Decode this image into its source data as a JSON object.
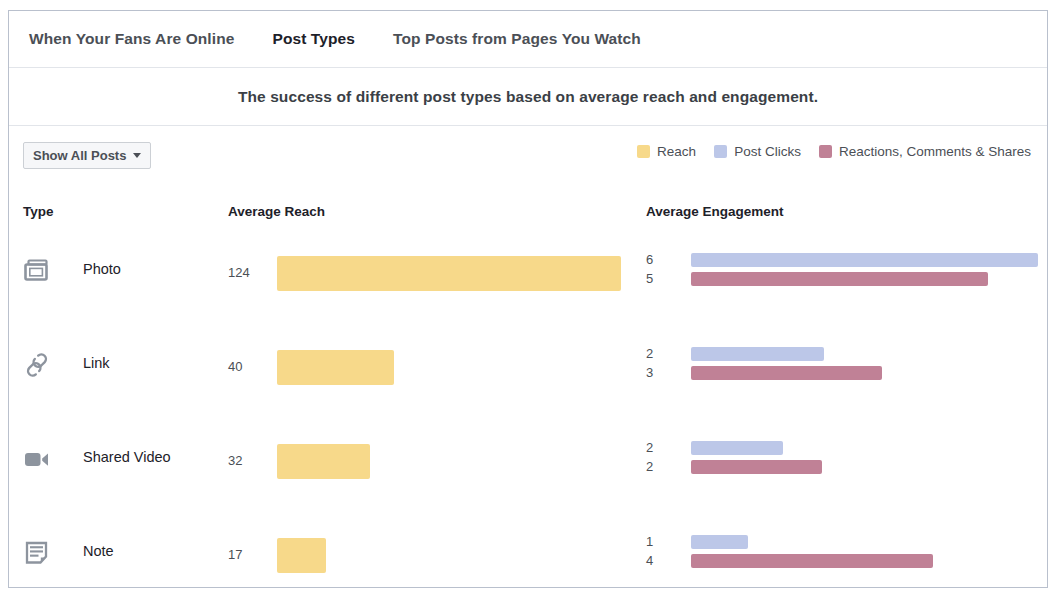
{
  "tabs": [
    {
      "label": "When Your Fans Are Online",
      "active": false
    },
    {
      "label": "Post Types",
      "active": true
    },
    {
      "label": "Top Posts from Pages You Watch",
      "active": false
    }
  ],
  "subtitle": "The success of different post types based on average reach and engagement.",
  "filter": {
    "label": "Show All Posts"
  },
  "legend": [
    {
      "label": "Reach",
      "color": "#f7d98a"
    },
    {
      "label": "Post Clicks",
      "color": "#bcc7e8"
    },
    {
      "label": "Reactions, Comments & Shares",
      "color": "#c08196"
    }
  ],
  "columns": {
    "type": "Type",
    "average_reach": "Average Reach",
    "average_engagement": "Average Engagement"
  },
  "chart_data": {
    "type": "bar",
    "title": "The success of different post types based on average reach and engagement.",
    "orientation": "horizontal",
    "categories": [
      "Photo",
      "Link",
      "Shared Video",
      "Note"
    ],
    "series": [
      {
        "name": "Reach",
        "color": "#f7d98a",
        "values": [
          124,
          40,
          32,
          17
        ]
      },
      {
        "name": "Post Clicks",
        "color": "#bcc7e8",
        "values": [
          6,
          2,
          2,
          1
        ]
      },
      {
        "name": "Reactions, Comments & Shares",
        "color": "#c08196",
        "values": [
          5,
          3,
          2,
          4
        ]
      }
    ],
    "xlabel": "",
    "ylabel": "",
    "grid": false,
    "legend_position": "top-right"
  },
  "rows": [
    {
      "icon": "photo-icon",
      "label": "Photo",
      "reach": "124",
      "reach_bar_px": 344,
      "clicks": "6",
      "clicks_bar_px": 347,
      "reactions": "5",
      "reactions_bar_px": 297
    },
    {
      "icon": "link-icon",
      "label": "Link",
      "reach": "40",
      "reach_bar_px": 117,
      "clicks": "2",
      "clicks_bar_px": 133,
      "reactions": "3",
      "reactions_bar_px": 191
    },
    {
      "icon": "video-icon",
      "label": "Shared Video",
      "reach": "32",
      "reach_bar_px": 93,
      "clicks": "2",
      "clicks_bar_px": 92,
      "reactions": "2",
      "reactions_bar_px": 131
    },
    {
      "icon": "note-icon",
      "label": "Note",
      "reach": "17",
      "reach_bar_px": 49,
      "clicks": "1",
      "clicks_bar_px": 57,
      "reactions": "4",
      "reactions_bar_px": 242
    }
  ]
}
